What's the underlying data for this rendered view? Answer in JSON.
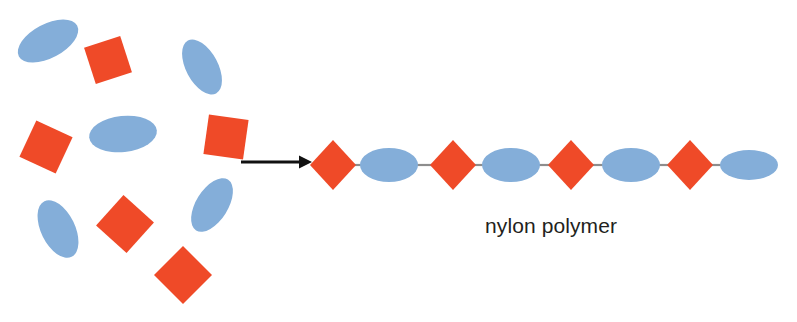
{
  "diagram": {
    "background_color": "#ffffff",
    "label": "nylon polymer",
    "label_color": "#231f20",
    "monomer_colors": {
      "diacid_square": "#ef4a28",
      "diamine_ellipse": "#84aed9",
      "bond_line": "#8d8d8d",
      "arrow": "#111111"
    },
    "monomer_pool": {
      "caption_none": "",
      "squares": [
        {
          "name": "monomer-square-1",
          "cx": 108,
          "cy": 60,
          "size": 38,
          "rotation": -18
        },
        {
          "name": "monomer-square-2",
          "cx": 46,
          "cy": 147,
          "size": 40,
          "rotation": 25
        },
        {
          "name": "monomer-square-3",
          "cx": 226,
          "cy": 137,
          "size": 40,
          "rotation": 8
        },
        {
          "name": "monomer-square-4",
          "cx": 125,
          "cy": 224,
          "size": 41,
          "rotation": 42
        },
        {
          "name": "monomer-square-5",
          "cx": 183,
          "cy": 275,
          "size": 41,
          "rotation": 45
        }
      ],
      "ellipses": [
        {
          "name": "monomer-ellipse-1",
          "cx": 48,
          "cy": 41,
          "rx": 33,
          "ry": 17,
          "rotation": -28
        },
        {
          "name": "monomer-ellipse-2",
          "cx": 202,
          "cy": 67,
          "rx": 30,
          "ry": 16,
          "rotation": 62
        },
        {
          "name": "monomer-ellipse-3",
          "cx": 123,
          "cy": 134,
          "rx": 34,
          "ry": 18,
          "rotation": -6
        },
        {
          "name": "monomer-ellipse-4",
          "cx": 58,
          "cy": 229,
          "rx": 31,
          "ry": 17,
          "rotation": 64
        },
        {
          "name": "monomer-ellipse-5",
          "cx": 212,
          "cy": 205,
          "rx": 30,
          "ry": 16,
          "rotation": -58
        }
      ]
    },
    "arrow": {
      "name": "reaction-arrow",
      "x1": 241,
      "y1": 162,
      "x2": 312,
      "y2": 162,
      "head_size": 11
    },
    "polymer_chain": {
      "baseline_y": 165,
      "units": [
        {
          "name": "chain-diamond-1",
          "type": "diamond",
          "cx": 333,
          "half": 23
        },
        {
          "name": "chain-ellipse-1",
          "type": "ellipse",
          "cx": 389,
          "rx": 29,
          "ry": 17
        },
        {
          "name": "chain-diamond-2",
          "type": "diamond",
          "cx": 453,
          "half": 23
        },
        {
          "name": "chain-ellipse-2",
          "type": "ellipse",
          "cx": 511,
          "rx": 29,
          "ry": 17
        },
        {
          "name": "chain-diamond-3",
          "type": "diamond",
          "cx": 571,
          "half": 23
        },
        {
          "name": "chain-ellipse-3",
          "type": "ellipse",
          "cx": 631,
          "rx": 29,
          "ry": 17
        },
        {
          "name": "chain-diamond-4",
          "type": "diamond",
          "cx": 690,
          "half": 23
        },
        {
          "name": "chain-ellipse-4",
          "type": "ellipse",
          "cx": 749,
          "rx": 29,
          "ry": 15
        }
      ],
      "label_x": 485,
      "label_y": 233
    }
  }
}
